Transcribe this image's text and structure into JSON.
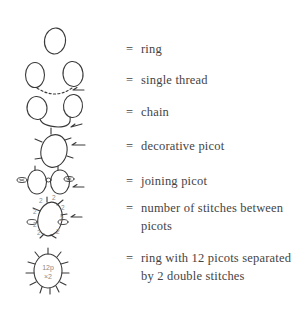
{
  "legend": {
    "items": [
      {
        "symbol": "ring-icon",
        "equals": "=",
        "label": "ring"
      },
      {
        "symbol": "single-thread-icon",
        "equals": "=",
        "label": "single thread"
      },
      {
        "symbol": "chain-icon",
        "equals": "=",
        "label": "chain"
      },
      {
        "symbol": "decorative-picot-icon",
        "equals": "=",
        "label": "decorative picot"
      },
      {
        "symbol": "joining-picot-icon",
        "equals": "=",
        "label": "joining picot"
      },
      {
        "symbol": "stitch-count-icon",
        "equals": "=",
        "label": "number of stitches between picots"
      },
      {
        "symbol": "ring-12-picots-icon",
        "equals": "=",
        "label": "ring with 12 picots separated by 2 double stitches"
      }
    ],
    "stitch_count_numbers": [
      "2",
      "2",
      "2",
      "2",
      "2",
      "2",
      "2",
      "2"
    ],
    "ring_center_text": [
      "12p",
      "×2"
    ]
  },
  "colors": {
    "ink": "#3a3a3a",
    "faint": "#8a8a8a"
  }
}
